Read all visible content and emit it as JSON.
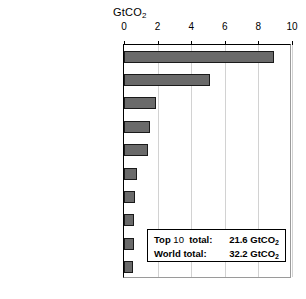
{
  "chart_data": {
    "type": "bar",
    "orientation": "horizontal",
    "title": "GtCO2",
    "title_display": "GtCO",
    "title_sub": "2",
    "xlabel": "GtCO2",
    "ylabel": "",
    "xlim": [
      0,
      10
    ],
    "xticks": [
      0,
      2,
      4,
      6,
      8,
      10
    ],
    "grid": true,
    "legend": "none",
    "categories": [
      "China",
      "United States",
      "India",
      "Russian Federation",
      "Japan",
      "Germany",
      "Korea",
      "Canada",
      "Islamic Republic of Iran",
      "Saudi Arabia"
    ],
    "values": [
      8.9,
      5.1,
      1.9,
      1.55,
      1.4,
      0.8,
      0.65,
      0.6,
      0.58,
      0.55
    ],
    "units": "GtCO2",
    "bar_fill": "#6a6a6a",
    "bar_edge": "#1a1a1a",
    "gridline_color": "#d2d2d2",
    "annotations": [
      {
        "label_bold": "Top",
        "label_plain": "10",
        "label_tail": "total:",
        "value": "21.6",
        "unit": "GtCO",
        "unit_sub": "2"
      },
      {
        "label_bold": "World",
        "label_plain": "",
        "label_tail": "total:",
        "value": "32.2",
        "unit": "GtCO",
        "unit_sub": "2"
      }
    ]
  },
  "annotation_box": {
    "row1_label": "Top 10  total:",
    "row1_value": "21.6 GtCO2",
    "row2_label": "World total:",
    "row2_value": "32.2 GtCO2"
  }
}
